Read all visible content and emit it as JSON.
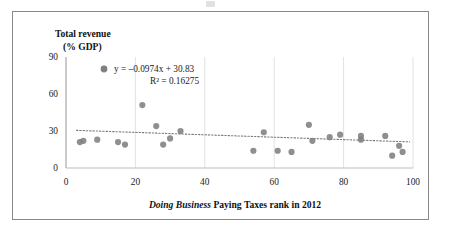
{
  "figure": {
    "border_color": "#8a8a8a",
    "background": "#ffffff"
  },
  "axis_titles": {
    "y_line1": "Total revenue",
    "y_line2": "(% GDP)",
    "x_title_italic": "Doing Business",
    "x_title_rest": " Paying Taxes rank in 2012"
  },
  "annotation": {
    "equation": "y = –0.0974x + 30.83",
    "r_squared": "R² = 0.16275",
    "marker_color": "#808080"
  },
  "chart_data": {
    "type": "scatter",
    "title": "",
    "xlabel": "Doing Business Paying Taxes rank in 2012",
    "ylabel": "Total revenue (% GDP)",
    "xlim": [
      0,
      100
    ],
    "ylim": [
      0,
      90
    ],
    "xticks": [
      0,
      20,
      40,
      60,
      80,
      100
    ],
    "yticks": [
      0,
      30,
      60,
      90
    ],
    "grid": "vertical-major-light",
    "legend": "none",
    "marker_color": "#808080",
    "marker_size": 5,
    "points": [
      {
        "x": 4,
        "y": 21
      },
      {
        "x": 5,
        "y": 22
      },
      {
        "x": 9,
        "y": 23
      },
      {
        "x": 15,
        "y": 21
      },
      {
        "x": 17,
        "y": 19
      },
      {
        "x": 22,
        "y": 51
      },
      {
        "x": 26,
        "y": 34
      },
      {
        "x": 28,
        "y": 19
      },
      {
        "x": 30,
        "y": 24
      },
      {
        "x": 33,
        "y": 30
      },
      {
        "x": 54,
        "y": 14
      },
      {
        "x": 57,
        "y": 29
      },
      {
        "x": 61,
        "y": 14
      },
      {
        "x": 65,
        "y": 13
      },
      {
        "x": 70,
        "y": 35
      },
      {
        "x": 71,
        "y": 22
      },
      {
        "x": 76,
        "y": 25
      },
      {
        "x": 79,
        "y": 27
      },
      {
        "x": 85,
        "y": 26
      },
      {
        "x": 85,
        "y": 23
      },
      {
        "x": 92,
        "y": 26
      },
      {
        "x": 94,
        "y": 10
      },
      {
        "x": 96,
        "y": 18
      },
      {
        "x": 97,
        "y": 13
      }
    ],
    "trendline": {
      "slope": -0.0974,
      "intercept": 30.83,
      "r_squared": 0.16275,
      "style": "dotted",
      "color": "#7a7a7a",
      "x_start": 3,
      "x_end": 99
    }
  }
}
